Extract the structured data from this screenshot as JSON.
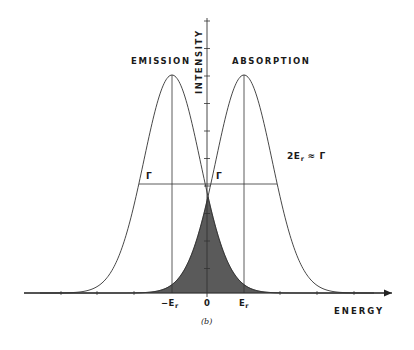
{
  "figure": {
    "caption": "(b)",
    "labels": {
      "emission": "EMISSION",
      "absorption": "ABSORPTION",
      "y_axis": "INTENSITY",
      "x_axis": "ENERGY",
      "gamma_left": "Γ",
      "gamma_right": "Γ",
      "relation_prefix": "2E",
      "relation_sub": "r",
      "relation_suffix": " ≈ Γ",
      "tick_neg_er": "−E",
      "tick_neg_er_sub": "r",
      "tick_zero": "0",
      "tick_er": "E",
      "tick_er_sub": "r"
    },
    "colors": {
      "line": "#333333",
      "shade": "#5a5a5a",
      "background": "#ffffff"
    }
  },
  "chart_data": {
    "type": "line",
    "title": "",
    "xlabel": "ENERGY",
    "ylabel": "INTENSITY",
    "x_ticks": [
      "-Er",
      "0",
      "Er"
    ],
    "series": [
      {
        "name": "EMISSION",
        "center": "-Er",
        "peak": 1.0,
        "fwhm": "Γ"
      },
      {
        "name": "ABSORPTION",
        "center": "Er",
        "peak": 1.0,
        "fwhm": "Γ"
      }
    ],
    "annotations": [
      "Γ (full width at half maximum) marked on both curves",
      "2Er ≈ Γ",
      "Shaded overlap region between curves centered at 0"
    ],
    "grid": false,
    "legend": "none"
  }
}
